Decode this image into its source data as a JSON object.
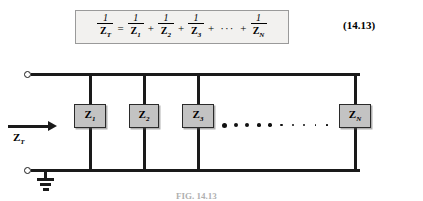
{
  "equation": {
    "number": "(14.13)",
    "lhs": {
      "numerator": "1",
      "denominator": "Z",
      "subscript": "T"
    },
    "equals": "=",
    "terms": [
      {
        "numerator": "1",
        "denominator": "Z",
        "subscript": "1"
      },
      {
        "numerator": "1",
        "denominator": "Z",
        "subscript": "2"
      },
      {
        "numerator": "1",
        "denominator": "Z",
        "subscript": "3"
      },
      {
        "numerator": "1",
        "denominator": "Z",
        "subscript": "N"
      }
    ],
    "plus": "+",
    "ellipsis": "···"
  },
  "circuit": {
    "source_label": {
      "symbol": "Z",
      "subscript": "T"
    },
    "ground_label": "ground-symbol",
    "ellipsis_dots": 10,
    "impedances": [
      {
        "symbol": "Z",
        "subscript": "1",
        "x": 74,
        "width": 32
      },
      {
        "symbol": "Z",
        "subscript": "2",
        "x": 129,
        "width": 30
      },
      {
        "symbol": "Z",
        "subscript": "3",
        "x": 182,
        "width": 32
      },
      {
        "symbol": "Z",
        "subscript": "N",
        "x": 339,
        "width": 32
      }
    ]
  },
  "caption": "FIG. 14.13"
}
